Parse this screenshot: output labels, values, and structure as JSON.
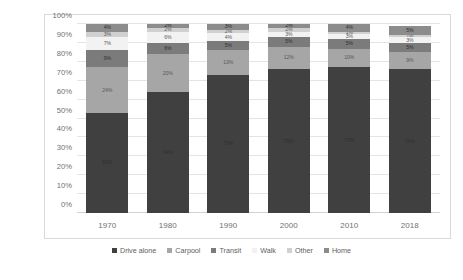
{
  "chart_data": {
    "type": "bar",
    "subtype": "stacked-100-percent",
    "title": "",
    "xlabel": "",
    "ylabel": "Percent of Workers",
    "categories": [
      "1970",
      "1980",
      "1990",
      "2000",
      "2010",
      "2018"
    ],
    "ylim": [
      0,
      100
    ],
    "ytick_labels": [
      "0%",
      "10%",
      "20%",
      "30%",
      "40%",
      "50%",
      "60%",
      "70%",
      "80%",
      "90%",
      "100%"
    ],
    "ytick_values": [
      0,
      10,
      20,
      30,
      40,
      50,
      60,
      70,
      80,
      90,
      100
    ],
    "grid": true,
    "legend_position": "bottom",
    "series": [
      {
        "name": "Drive alone",
        "color": "#404040",
        "values": [
          53,
          64,
          73,
          76,
          77,
          76
        ],
        "labels": [
          "53%",
          "64%",
          "73%",
          "76%",
          "77%",
          "76%"
        ]
      },
      {
        "name": "Carpool",
        "color": "#a6a6a6",
        "values": [
          24,
          20,
          13,
          12,
          10,
          9
        ],
        "labels": [
          "24%",
          "20%",
          "13%",
          "12%",
          "10%",
          "9%"
        ]
      },
      {
        "name": "Transit",
        "color": "#7b7b7b",
        "values": [
          9,
          6,
          5,
          5,
          5,
          5
        ],
        "labels": [
          "9%",
          "6%",
          "5%",
          "5%",
          "5%",
          "5%"
        ]
      },
      {
        "name": "Walk",
        "color": "#f2f2f2",
        "values": [
          7,
          6,
          4,
          3,
          3,
          3
        ],
        "labels": [
          "7%",
          "6%",
          "4%",
          "3%",
          "3%",
          "3%"
        ]
      },
      {
        "name": "Other",
        "color": "#d0d0d0",
        "values": [
          3,
          2,
          2,
          2,
          1,
          1
        ],
        "labels": [
          "3%",
          "2%",
          "2%",
          "2%",
          "1%",
          "1%"
        ]
      },
      {
        "name": "Home",
        "color": "#8c8c8c",
        "values": [
          4,
          2,
          3,
          2,
          4,
          5
        ],
        "labels": [
          "4%",
          "2%",
          "3%",
          "2%",
          "4%",
          "5%"
        ]
      }
    ]
  }
}
